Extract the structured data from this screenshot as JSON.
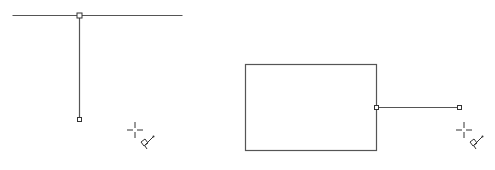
{
  "canvas": {
    "width": 495,
    "height": 170,
    "background": "#ffffff",
    "stroke": "#555555"
  },
  "panels": [
    {
      "name": "left-panel",
      "lines": [
        {
          "name": "horizontal-line",
          "x1": 12,
          "y1": 15,
          "x2": 182,
          "y2": 15
        },
        {
          "name": "vertical-connector-line",
          "x1": 79,
          "y1": 15,
          "x2": 79,
          "y2": 119
        }
      ],
      "handles": [
        {
          "name": "start-handle",
          "x": 79,
          "y": 15,
          "size": 5
        },
        {
          "name": "end-handle",
          "x": 79,
          "y": 119,
          "size": 4
        }
      ],
      "cursor": {
        "icon": "crosshair-connector-cursor-icon",
        "x": 135,
        "y": 130
      }
    },
    {
      "name": "right-panel",
      "rect": {
        "name": "rectangle-shape",
        "x": 245,
        "y": 64,
        "w": 131,
        "h": 86
      },
      "lines": [
        {
          "name": "horizontal-connector-line",
          "x1": 376,
          "y1": 107,
          "x2": 459,
          "y2": 107
        }
      ],
      "handles": [
        {
          "name": "start-handle",
          "x": 376,
          "y": 107,
          "size": 4
        },
        {
          "name": "end-handle",
          "x": 459,
          "y": 107,
          "size": 4
        }
      ],
      "cursor": {
        "icon": "crosshair-connector-cursor-icon",
        "x": 464,
        "y": 130
      }
    }
  ]
}
